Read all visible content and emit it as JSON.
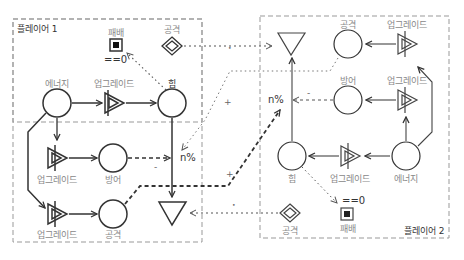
{
  "diagram": {
    "player1": {
      "title": "플레이어 1",
      "nodes": {
        "energy": "에너지",
        "upgrade_power": "업그레이드",
        "power": "힘",
        "upgrade_defense": "업그레이드",
        "defense": "방어",
        "upgrade_attack": "업그레이드",
        "attack": "공격",
        "lose": "패배",
        "attack_trigger": "공격"
      },
      "lose_condition": "==0",
      "modifier": "n%"
    },
    "player2": {
      "title": "플레이어 2",
      "nodes": {
        "energy": "에너지",
        "upgrade_power": "업그레이드",
        "power": "힘",
        "upgrade_defense": "업그레이드",
        "defense": "방어",
        "upgrade_attack": "업그레이드",
        "attack": "공격",
        "lose": "패배",
        "attack_trigger": "공격"
      },
      "lose_condition": "==0",
      "modifier": "n%"
    },
    "signs": {
      "minus": "-",
      "plus": "+",
      "dot": "•"
    },
    "colors": {
      "stroke": "#333333",
      "label": "#888888",
      "border": "#999999"
    }
  }
}
